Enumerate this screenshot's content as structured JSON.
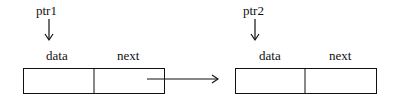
{
  "diagram": {
    "type": "linked-list",
    "nodes": [
      {
        "pointer_label": "ptr1",
        "fields": [
          {
            "name": "data"
          },
          {
            "name": "next"
          }
        ]
      },
      {
        "pointer_label": "ptr2",
        "fields": [
          {
            "name": "data"
          },
          {
            "name": "next"
          }
        ]
      }
    ],
    "edges": [
      {
        "from": "node1.next",
        "to": "node2"
      }
    ]
  }
}
